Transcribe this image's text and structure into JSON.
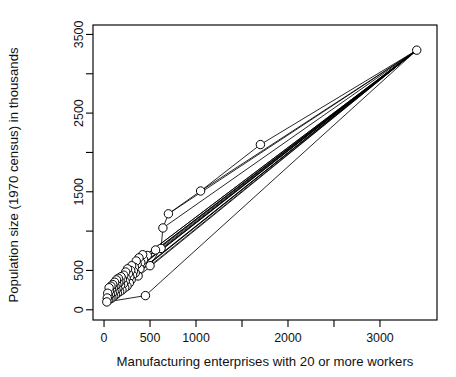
{
  "chart_data": {
    "type": "scatter",
    "title": "",
    "xlabel": "Manufacturing enterprises with 20 or more workers",
    "ylabel": "Population size (1970 census) in thousands",
    "xlim": [
      -120,
      3620
    ],
    "ylim": [
      -130,
      3620
    ],
    "grid": false,
    "legend": "none",
    "x_ticks": [
      0,
      500,
      1000,
      1500,
      2000,
      2500,
      3000
    ],
    "x_tick_labels": [
      "0",
      "500",
      "1000",
      "",
      "2000",
      "",
      "3000"
    ],
    "y_ticks": [
      0,
      500,
      1000,
      1500,
      2000,
      2500,
      3000,
      3500
    ],
    "y_tick_labels": [
      "0",
      "500",
      "",
      "1500",
      "",
      "2500",
      "",
      "3500"
    ],
    "point_marker": "open-circle",
    "marker_radius_px": 4.2,
    "x": [
      3400,
      1700,
      1050,
      700,
      640,
      620,
      560,
      500,
      470,
      450,
      430,
      420,
      400,
      390,
      380,
      370,
      360,
      350,
      340,
      330,
      320,
      310,
      300,
      295,
      290,
      280,
      275,
      265,
      255,
      250,
      240,
      235,
      230,
      225,
      215,
      210,
      200,
      195,
      185,
      180,
      175,
      170,
      160,
      155,
      150,
      145,
      140,
      135,
      130,
      125,
      120,
      115,
      110,
      105,
      100,
      95,
      90,
      85,
      80,
      75,
      70,
      65,
      60,
      55,
      50,
      45,
      40,
      35,
      30
    ],
    "y": [
      3300,
      2100,
      1510,
      1220,
      1040,
      780,
      760,
      560,
      690,
      180,
      640,
      700,
      600,
      520,
      660,
      430,
      580,
      620,
      470,
      540,
      490,
      440,
      560,
      380,
      500,
      420,
      340,
      460,
      520,
      300,
      400,
      480,
      360,
      280,
      440,
      330,
      390,
      250,
      420,
      310,
      360,
      230,
      340,
      400,
      270,
      210,
      320,
      380,
      250,
      190,
      300,
      350,
      230,
      170,
      280,
      320,
      210,
      150,
      260,
      300,
      190,
      140,
      240,
      280,
      170,
      120,
      210,
      150,
      100
    ],
    "edges_description": "Each plotted city is joined by a straight line segment to the large metropolitan outlier at the upper right, producing a fan of near-parallel rays converging on the dense low-value cluster.",
    "edges": [
      [
        3400,
        3300,
        1700,
        2100
      ],
      [
        3400,
        3300,
        1050,
        1510
      ],
      [
        3400,
        3300,
        700,
        1220
      ],
      [
        3400,
        3300,
        640,
        1040
      ],
      [
        3400,
        3300,
        620,
        780
      ],
      [
        3400,
        3300,
        500,
        560
      ],
      [
        3400,
        3300,
        450,
        180
      ],
      [
        3400,
        3300,
        430,
        640
      ],
      [
        3400,
        3300,
        400,
        600
      ],
      [
        3400,
        3300,
        360,
        580
      ],
      [
        3400,
        3300,
        300,
        560
      ],
      [
        3400,
        3300,
        255,
        520
      ],
      [
        3400,
        3300,
        210,
        330
      ],
      [
        3400,
        3300,
        175,
        360
      ],
      [
        3400,
        3300,
        140,
        320
      ],
      [
        3400,
        3300,
        110,
        230
      ],
      [
        3400,
        3300,
        80,
        260
      ],
      [
        3400,
        3300,
        50,
        170
      ],
      [
        3400,
        3300,
        30,
        100
      ],
      [
        1700,
        2100,
        1050,
        1510
      ],
      [
        1050,
        1510,
        700,
        1220
      ],
      [
        700,
        1220,
        640,
        1040
      ],
      [
        640,
        1040,
        620,
        780
      ],
      [
        620,
        780,
        500,
        560
      ],
      [
        500,
        560,
        430,
        640
      ],
      [
        430,
        640,
        400,
        600
      ],
      [
        400,
        600,
        360,
        580
      ],
      [
        360,
        580,
        300,
        560
      ],
      [
        300,
        560,
        255,
        520
      ],
      [
        255,
        520,
        210,
        330
      ],
      [
        210,
        330,
        175,
        360
      ],
      [
        175,
        360,
        140,
        320
      ],
      [
        140,
        320,
        110,
        230
      ],
      [
        110,
        230,
        80,
        260
      ],
      [
        80,
        260,
        50,
        170
      ],
      [
        50,
        170,
        30,
        100
      ],
      [
        30,
        100,
        450,
        180
      ]
    ]
  },
  "axes": {
    "x_axis_label": "Manufacturing enterprises with 20 or more workers",
    "y_axis_label": "Population size (1970 census) in thousands"
  }
}
